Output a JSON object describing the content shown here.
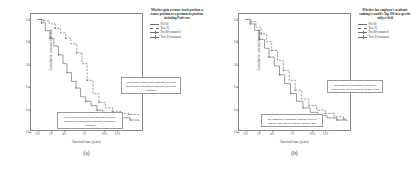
{
  "figure": {
    "background": "#ffffff",
    "line_color": "#6f6f6f",
    "frame_color": "#8a8a8a"
  },
  "chart_data": [
    {
      "type": "line",
      "subtype": "kaplan-meier-step",
      "panel": "(a)",
      "title": "",
      "xlabel": "Survival time (years)",
      "ylabel": "Cumulative survival function",
      "xlim": [
        -1.0,
        16.0
      ],
      "ylim": [
        0.0,
        1.05
      ],
      "xticks": [
        0.0,
        2.0,
        4.0,
        7.0,
        10.0,
        12.0
      ],
      "xtick_labels": [
        "0.0",
        "2.0",
        "4.0",
        "7.0",
        "10.0",
        "12.0"
      ],
      "yticks": [
        0.0,
        0.2,
        0.4,
        0.6,
        0.8,
        1.0
      ],
      "ytick_labels": [
        "0.0",
        "0.2",
        "0.4",
        "0.6",
        "0.8",
        "1.0"
      ],
      "grid": false,
      "legend_position": "right",
      "legend_title": "Whether gain a tenure-track position, a tenure position or a permanent position, including Professor",
      "legend_entries": [
        {
          "label": "No (0)",
          "style": "solid"
        },
        {
          "label": "Yes (1)",
          "style": "dashed"
        },
        {
          "label": "No (0)-censored",
          "style": "solid-censored"
        },
        {
          "label": "Yes (1)-censored",
          "style": "dashed-censored"
        }
      ],
      "series": [
        {
          "name": "No (0)",
          "label": "Never gain a tenure-track position, a tenure position or a permanent position, including Professor",
          "style": "solid",
          "x": [
            0.0,
            0.6,
            1.2,
            1.9,
            2.5,
            3.2,
            3.9,
            4.5,
            5.2,
            5.9,
            6.6,
            7.4,
            8.2,
            9.1,
            10.0,
            11.2,
            12.6,
            14.2,
            15.5
          ],
          "y": [
            1.0,
            0.97,
            0.9,
            0.83,
            0.76,
            0.68,
            0.6,
            0.52,
            0.44,
            0.38,
            0.3,
            0.26,
            0.22,
            0.18,
            0.15,
            0.13,
            0.11,
            0.09,
            0.08
          ]
        },
        {
          "name": "Yes (1)",
          "label": "Have gain a tenure-track position, a tenure position or a permanent position, including Professor",
          "style": "dashed",
          "x": [
            0.0,
            0.9,
            1.8,
            2.7,
            3.5,
            4.3,
            5.1,
            6.0,
            6.8,
            7.6,
            8.5,
            9.4,
            10.4,
            11.5,
            12.8,
            14.0,
            15.5
          ],
          "y": [
            1.0,
            0.99,
            0.96,
            0.92,
            0.88,
            0.83,
            0.78,
            0.7,
            0.6,
            0.45,
            0.33,
            0.25,
            0.2,
            0.17,
            0.15,
            0.14,
            0.13
          ]
        }
      ],
      "annotations": [
        {
          "text": "Never gain a tenure-track position, a tenure position or a permanent position, including Professor",
          "x_px": 26,
          "y_px": 98,
          "w_px": 66,
          "h_px": 24
        },
        {
          "text": "Have gain a tenure-track position, a tenure position or a permanent position, including Professor",
          "x_px": 90,
          "y_px": 63,
          "w_px": 60,
          "h_px": 22
        }
      ]
    },
    {
      "type": "line",
      "subtype": "kaplan-meier-step",
      "panel": "(b)",
      "title": "",
      "xlabel": "Survival time (years)",
      "ylabel": "Cumulative survival function",
      "xlim": [
        -1.0,
        16.0
      ],
      "ylim": [
        0.0,
        1.05
      ],
      "xticks": [
        0.0,
        2.0,
        4.0,
        7.0,
        10.0,
        12.0
      ],
      "xtick_labels": [
        "0.0",
        "2.0",
        "4.0",
        "7.0",
        "10.0",
        "12.0"
      ],
      "yticks": [
        0.0,
        0.2,
        0.4,
        0.6,
        0.8,
        1.0
      ],
      "ytick_labels": [
        "0.0",
        "0.2",
        "0.4",
        "0.6",
        "0.8",
        "1.0"
      ],
      "grid": false,
      "legend_position": "right",
      "legend_title": "Whether last employer's academic ranking is world's Top 100 in a specific subject field",
      "legend_entries": [
        {
          "label": "No (0)",
          "style": "solid"
        },
        {
          "label": "Yes (1)",
          "style": "dashed"
        },
        {
          "label": "No (0)-censored",
          "style": "solid-censored"
        },
        {
          "label": "Yes (1)-censored",
          "style": "dashed-censored"
        }
      ],
      "series": [
        {
          "name": "No (0)",
          "label": "last employer's academic ranking is out of world's Top 100 in a specific subject field",
          "style": "solid",
          "x": [
            0.0,
            0.7,
            1.4,
            2.1,
            2.9,
            3.6,
            4.4,
            5.2,
            6.0,
            6.9,
            7.8,
            8.8,
            9.9,
            11.1,
            12.5,
            14.0,
            15.5
          ],
          "y": [
            1.0,
            0.96,
            0.9,
            0.82,
            0.74,
            0.66,
            0.58,
            0.5,
            0.42,
            0.33,
            0.26,
            0.2,
            0.16,
            0.13,
            0.11,
            0.09,
            0.08
          ]
        },
        {
          "name": "Yes (1)",
          "label": "last employer's academic ranking is world's Top 100 in a specific subject field",
          "style": "dashed",
          "x": [
            0.0,
            0.8,
            1.6,
            2.4,
            3.2,
            4.0,
            4.9,
            5.8,
            6.7,
            7.6,
            8.6,
            9.7,
            10.9,
            12.2,
            13.6,
            15.0,
            15.5
          ],
          "y": [
            1.0,
            0.98,
            0.93,
            0.87,
            0.8,
            0.72,
            0.63,
            0.54,
            0.45,
            0.36,
            0.28,
            0.22,
            0.18,
            0.15,
            0.12,
            0.1,
            0.09
          ]
        }
      ],
      "annotations": [
        {
          "text": "last employer's academic ranking is out of world's Top 100 in a specific subject field",
          "x_px": 22,
          "y_px": 100,
          "w_px": 62,
          "h_px": 22
        },
        {
          "text": "last employer's academic ranking is world's Top 100 in a specific subject field",
          "x_px": 88,
          "y_px": 66,
          "w_px": 56,
          "h_px": 22
        }
      ]
    }
  ]
}
